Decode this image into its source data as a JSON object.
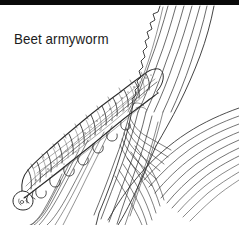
{
  "figure": {
    "title": "Beet armyworm",
    "style": "black-and-white line drawing",
    "background_color": "#ffffff",
    "ink_color": "#333333",
    "top_band_color": "#0a0a0a",
    "width_px": 239,
    "height_px": 225
  },
  "caption": {
    "text": "Beet armyworm",
    "color": "#1c1c1c",
    "x_px": 14,
    "y_px": 31
  },
  "elements": {
    "caterpillar": {
      "label": "beet armyworm larva",
      "orientation": "diagonal, head at lower-left, tail at upper-right",
      "segment_count": 12,
      "features": [
        "segmented body",
        "prolegs",
        "head capsule",
        "stippled shading"
      ]
    },
    "leaf_primary": {
      "label": "leaf blade with chewed margin",
      "orientation": "diagonal from lower-left to upper-right",
      "features": [
        "jagged chewed edge",
        "parallel veins"
      ]
    },
    "leaf_secondary": {
      "label": "crossing leaf blade",
      "orientation": "diagonal from lower-left to right edge",
      "features": [
        "parallel veins",
        "overlap shading"
      ]
    }
  }
}
